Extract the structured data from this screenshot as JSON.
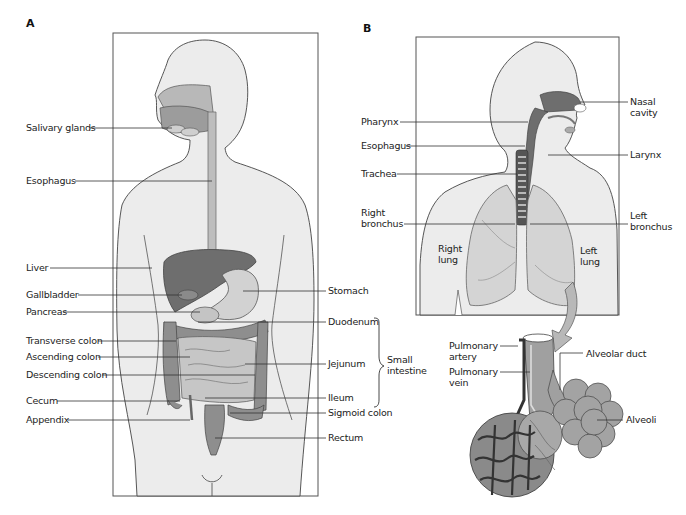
{
  "panels": {
    "a": {
      "letter": "A",
      "title": "Digestive system",
      "labels_left": {
        "salivary_glands": "Salivary glands",
        "esophagus": "Esophagus",
        "liver": "Liver",
        "gallbladder": "Gallbladder",
        "pancreas": "Pancreas",
        "transverse_colon": "Transverse colon",
        "ascending_colon": "Ascending colon",
        "descending_colon": "Descending colon",
        "cecum": "Cecum",
        "appendix": "Appendix"
      },
      "labels_right": {
        "stomach": "Stomach",
        "duodenum": "Duodenum",
        "jejunum": "Jejunum",
        "ileum": "Ileum",
        "sigmoid_colon": "Sigmoid colon",
        "rectum": "Rectum"
      },
      "group_label": {
        "line1": "Small",
        "line2": "intestine"
      }
    },
    "b": {
      "letter": "B",
      "title": "Respiratory system",
      "labels_left": {
        "pharynx": "Pharynx",
        "esophagus": "Esophagus",
        "trachea": "Trachea",
        "right_bronchus_1": "Right",
        "right_bronchus_2": "bronchus"
      },
      "labels_right": {
        "nasal_cavity_1": "Nasal",
        "nasal_cavity_2": "cavity",
        "larynx": "Larynx",
        "left_bronchus_1": "Left",
        "left_bronchus_2": "bronchus"
      },
      "lung_labels": {
        "right_lung_1": "Right",
        "right_lung_2": "lung",
        "left_lung_1": "Left",
        "left_lung_2": "lung"
      },
      "inset_labels": {
        "pulmonary_artery_1": "Pulmonary",
        "pulmonary_artery_2": "artery",
        "pulmonary_vein_1": "Pulmonary",
        "pulmonary_vein_2": "vein",
        "alveolar_duct": "Alveolar duct",
        "alveoli": "Alveoli"
      }
    }
  },
  "colors": {
    "body_fill": "#ececec",
    "outline": "#444444",
    "organ_dark": "#6e6e6e",
    "organ_mid": "#9a9a9a",
    "organ_light": "#c8c8c8",
    "lung_fill": "#d4d4d4",
    "leader_line": "#333333"
  }
}
